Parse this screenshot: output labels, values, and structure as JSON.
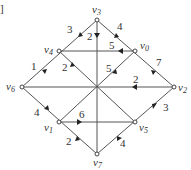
{
  "bracket": "]",
  "nodes": [
    {
      "id": "v0",
      "name": "v",
      "sub": "0"
    },
    {
      "id": "v1",
      "name": "v",
      "sub": "1"
    },
    {
      "id": "v2",
      "name": "v",
      "sub": "2"
    },
    {
      "id": "v3",
      "name": "v",
      "sub": "3"
    },
    {
      "id": "v4",
      "name": "v",
      "sub": "4"
    },
    {
      "id": "v5",
      "name": "v",
      "sub": "5"
    },
    {
      "id": "v6",
      "name": "v",
      "sub": "6"
    },
    {
      "id": "v7",
      "name": "v",
      "sub": "7"
    }
  ],
  "edges": [
    {
      "from": "v3",
      "to": "v4",
      "weight": "3"
    },
    {
      "from": "v3",
      "to": "center",
      "weight": "2"
    },
    {
      "from": "v0",
      "to": "v3",
      "weight": "4"
    },
    {
      "from": "v0",
      "to": "v4",
      "weight": "5"
    },
    {
      "from": "v4",
      "to": "v6",
      "weight": "1"
    },
    {
      "from": "v4",
      "to": "center",
      "weight": "2"
    },
    {
      "from": "v0",
      "to": "center",
      "weight": "5"
    },
    {
      "from": "v0",
      "to": "v2",
      "weight": "7"
    },
    {
      "from": "v2",
      "to": "center",
      "weight": "2"
    },
    {
      "from": "v1",
      "to": "v6",
      "weight": "4"
    },
    {
      "from": "v1",
      "to": "v5",
      "weight": "6"
    },
    {
      "from": "v2",
      "to": "v5",
      "weight": "3"
    },
    {
      "from": "v1",
      "to": "v7",
      "weight": "2"
    },
    {
      "from": "v5",
      "to": "v7",
      "weight": "4"
    }
  ]
}
